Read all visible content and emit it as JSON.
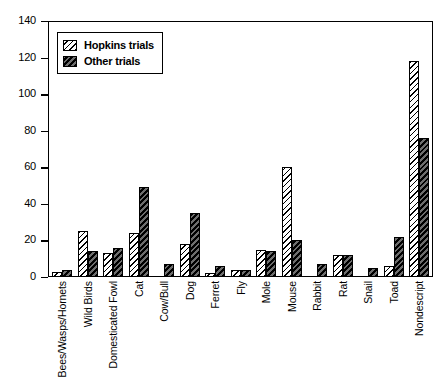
{
  "chart_data": {
    "type": "bar",
    "title": "",
    "subtitle": "",
    "xlabel": "",
    "ylabel": "",
    "ylim": [
      0,
      140
    ],
    "yticks": [
      0,
      20,
      40,
      60,
      80,
      100,
      120,
      140
    ],
    "grid": false,
    "legend_position": "top-left",
    "categories": [
      "Bees/Wasps/Hornets",
      "Wild Birds",
      "Domesticated Fowl",
      "Cat",
      "Cow/Bull",
      "Dog",
      "Ferret",
      "Fly",
      "Mole",
      "Mouse",
      "Rabbit",
      "Rat",
      "Snail",
      "Toad",
      "Nondescript"
    ],
    "series": [
      {
        "name": "Hopkins trials",
        "color": "#ffffff",
        "hatch": "light-diagonal",
        "values": [
          3,
          25,
          13,
          24,
          0,
          18,
          2,
          4,
          15,
          60,
          0,
          12,
          0,
          6,
          118
        ]
      },
      {
        "name": "Other trials",
        "color": "#2b2b2b",
        "hatch": "dark-diagonal",
        "values": [
          4,
          14,
          16,
          49,
          7,
          35,
          6,
          4,
          14,
          20,
          7,
          12,
          5,
          22,
          76
        ]
      }
    ]
  },
  "legend": {
    "entries": [
      {
        "label": "Hopkins trials",
        "swatch": "light-diagonal-hatch-swatch"
      },
      {
        "label": "Other trials",
        "swatch": "dark-diagonal-hatch-swatch"
      }
    ]
  }
}
